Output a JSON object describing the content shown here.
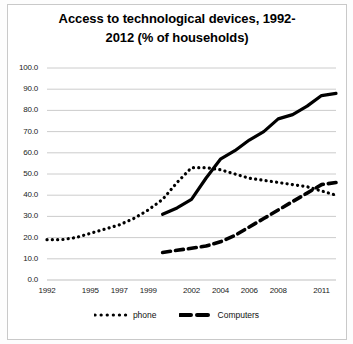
{
  "chart_data": {
    "type": "line",
    "title_line1": "Access to technological devices, 1992-",
    "title_line2": "2012 (% of households)",
    "xlabel": "",
    "ylabel": "",
    "grid": true,
    "legend_position": "bottom",
    "xlim": [
      1992,
      2012
    ],
    "ylim": [
      0,
      100
    ],
    "ytick_labels": [
      "0.0",
      "10.0",
      "20.0",
      "30.0",
      "40.0",
      "50.0",
      "60.0",
      "70.0",
      "80.0",
      "90.0",
      "100.0"
    ],
    "ytick_values": [
      0,
      10,
      20,
      30,
      40,
      50,
      60,
      70,
      80,
      90,
      100
    ],
    "xtick_labels": [
      "1992",
      "1995",
      "1997",
      "1999",
      "2002",
      "2004",
      "2006",
      "2008",
      "2011"
    ],
    "xtick_values": [
      1992,
      1995,
      1997,
      1999,
      2002,
      2004,
      2006,
      2008,
      2011
    ],
    "series": [
      {
        "name": "phone",
        "style": "dotted",
        "color": "#000000",
        "x": [
          1992,
          1993,
          1994,
          1995,
          1996,
          1997,
          1998,
          1999,
          2000,
          2001,
          2002,
          2003,
          2004,
          2005,
          2006,
          2007,
          2008,
          2009,
          2010,
          2011,
          2012
        ],
        "values": [
          19,
          19,
          20,
          22,
          24,
          26,
          29,
          33,
          38,
          46,
          53,
          53,
          52,
          50,
          48,
          47,
          46,
          45,
          44,
          42,
          40
        ]
      },
      {
        "name": "solid-series",
        "style": "solid",
        "color": "#000000",
        "x": [
          2000,
          2001,
          2002,
          2003,
          2004,
          2005,
          2006,
          2007,
          2008,
          2009,
          2010,
          2011,
          2012
        ],
        "values": [
          31,
          34,
          38,
          48,
          57,
          61,
          66,
          70,
          76,
          78,
          82,
          87,
          88
        ]
      },
      {
        "name": "Computers",
        "style": "dashed",
        "color": "#000000",
        "x": [
          2000,
          2001,
          2002,
          2003,
          2004,
          2005,
          2006,
          2007,
          2008,
          2009,
          2010,
          2011,
          2012
        ],
        "values": [
          13,
          14,
          15,
          16,
          18,
          21,
          25,
          29,
          33,
          37,
          41,
          45,
          46
        ]
      }
    ],
    "legend_entries": [
      {
        "label": "phone",
        "style": "dotted"
      },
      {
        "label": "Computers",
        "style": "dashed"
      }
    ]
  }
}
